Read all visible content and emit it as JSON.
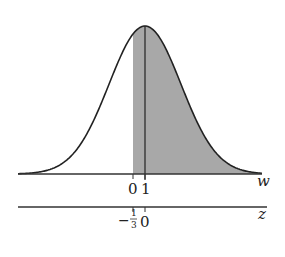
{
  "figure": {
    "colors": {
      "curve": "#222222",
      "shade": "#a8a8a8",
      "axis": "#333333"
    },
    "w_axis": {
      "label": "w",
      "ticks": [
        {
          "value": "0",
          "x": 133
        },
        {
          "value": "1",
          "x": 145
        }
      ]
    },
    "z_axis": {
      "label": "z",
      "ticks": [
        {
          "value": "-1/3",
          "x": 133,
          "num": "1",
          "den": "3",
          "sign": "−"
        },
        {
          "value": "0",
          "x": 145
        }
      ]
    },
    "mean_line_x": 145,
    "shade_start_x": 133
  }
}
